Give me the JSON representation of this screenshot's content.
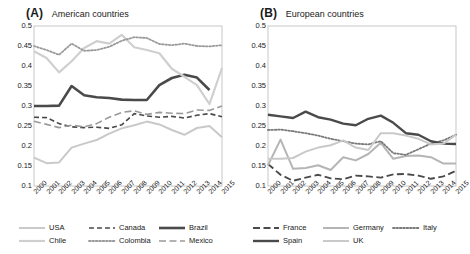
{
  "figure": {
    "panels": [
      {
        "letter": "(A)",
        "title": "American countries",
        "legend_rows": [
          [
            {
              "label": "USA",
              "key": "USA"
            },
            {
              "label": "Canada",
              "key": "Canada"
            },
            {
              "label": "Brazil",
              "key": "Brazil"
            }
          ],
          [
            {
              "label": "Chile",
              "key": "Chile"
            },
            {
              "label": "Colombia",
              "key": "Colombia"
            },
            {
              "label": "Mexico",
              "key": "Mexico"
            }
          ]
        ]
      },
      {
        "letter": "(B)",
        "title": "European countries",
        "legend_rows": [
          [
            {
              "label": "France",
              "key": "France"
            },
            {
              "label": "Germany",
              "key": "Germany"
            },
            {
              "label": "Italy",
              "key": "Italy"
            }
          ],
          [
            {
              "label": "Spain",
              "key": "Spain"
            },
            {
              "label": "UK",
              "key": "UK"
            }
          ]
        ]
      }
    ]
  },
  "chart_data": [
    {
      "type": "line",
      "title": "American countries",
      "panel": "(A)",
      "xlabel": "",
      "ylabel": "",
      "grid": false,
      "legend_position": "below",
      "x": [
        2000,
        2001,
        2002,
        2003,
        2004,
        2005,
        2006,
        2007,
        2008,
        2009,
        2010,
        2011,
        2012,
        2013,
        2014,
        2015
      ],
      "ylim": [
        0.1,
        0.5
      ],
      "yticks": [
        0.1,
        0.15,
        0.2,
        0.25,
        0.3,
        0.35,
        0.4,
        0.45,
        0.5
      ],
      "ytick_labels": [
        "0.1",
        "0.15",
        "0.2",
        "0.25",
        "0.3",
        "0.35",
        "0.4",
        "0.45",
        "0.5"
      ],
      "series": [
        {
          "name": "USA",
          "color": "#c9c9c9",
          "style": "solid",
          "width": 2.0,
          "values": [
            0.171,
            0.157,
            0.159,
            0.196,
            0.206,
            0.215,
            0.231,
            0.244,
            0.252,
            0.261,
            0.254,
            0.24,
            0.228,
            0.245,
            0.25,
            0.222
          ]
        },
        {
          "name": "Canada",
          "color": "#4a4a4a",
          "style": "dashed",
          "width": 1.6,
          "values": [
            0.272,
            0.271,
            0.256,
            0.248,
            0.246,
            0.247,
            0.244,
            0.253,
            0.281,
            0.275,
            0.272,
            0.274,
            0.27,
            0.277,
            0.281,
            0.273
          ]
        },
        {
          "name": "Brazil",
          "color": "#4a4a4a",
          "style": "solid",
          "width": 2.6,
          "values": [
            0.3,
            0.3,
            0.301,
            0.35,
            0.327,
            0.322,
            0.32,
            0.316,
            0.315,
            0.315,
            0.352,
            0.37,
            0.378,
            0.371,
            0.34,
            null
          ]
        },
        {
          "name": "Chile",
          "color": "#cfcfcf",
          "style": "solid",
          "width": 2.2,
          "values": [
            0.437,
            0.42,
            0.384,
            0.412,
            0.445,
            0.462,
            0.456,
            0.478,
            0.447,
            0.44,
            0.432,
            0.393,
            0.373,
            0.352,
            0.305,
            0.395
          ]
        },
        {
          "name": "Colombia",
          "color": "#9a9a9a",
          "style": "dotted",
          "width": 1.8,
          "values": [
            0.45,
            0.44,
            0.428,
            0.456,
            0.438,
            0.44,
            0.448,
            0.463,
            0.472,
            0.47,
            0.455,
            0.452,
            0.456,
            0.45,
            0.449,
            0.452
          ]
        },
        {
          "name": "Mexico",
          "color": "#9a9a9a",
          "style": "dash-long",
          "width": 1.6,
          "values": [
            0.262,
            0.254,
            0.246,
            0.252,
            0.248,
            0.256,
            0.272,
            0.284,
            0.288,
            0.279,
            0.284,
            0.282,
            0.281,
            0.29,
            0.289,
            0.3
          ]
        }
      ]
    },
    {
      "type": "line",
      "title": "European countries",
      "panel": "(B)",
      "xlabel": "",
      "ylabel": "",
      "grid": false,
      "legend_position": "below",
      "x": [
        2000,
        2001,
        2002,
        2003,
        2004,
        2005,
        2006,
        2007,
        2008,
        2009,
        2010,
        2011,
        2012,
        2013,
        2014,
        2015
      ],
      "ylim": [
        0.1,
        0.5
      ],
      "yticks": [
        0.1,
        0.15,
        0.2,
        0.25,
        0.3,
        0.35,
        0.4,
        0.45,
        0.5
      ],
      "ytick_labels": [
        "0.1",
        "0.15",
        "0.2",
        "0.25",
        "0.3",
        "0.35",
        "0.4",
        "0.45",
        "0.5"
      ],
      "series": [
        {
          "name": "France",
          "color": "#4a4a4a",
          "style": "dash-long",
          "width": 1.9,
          "values": [
            0.155,
            0.128,
            0.113,
            0.121,
            0.128,
            0.119,
            0.117,
            0.126,
            0.124,
            0.121,
            0.129,
            0.13,
            0.126,
            0.118,
            0.124,
            0.138
          ]
        },
        {
          "name": "Germany",
          "color": "#b5b5b5",
          "style": "solid",
          "width": 2.0,
          "values": [
            0.152,
            0.216,
            0.143,
            0.145,
            0.152,
            0.14,
            0.172,
            0.164,
            0.18,
            0.208,
            0.168,
            0.175,
            0.176,
            0.172,
            0.156,
            0.156
          ]
        },
        {
          "name": "Italy",
          "color": "#7a7a7a",
          "style": "dotted",
          "width": 1.8,
          "values": [
            0.24,
            0.241,
            0.237,
            0.232,
            0.226,
            0.218,
            0.212,
            0.206,
            0.204,
            0.212,
            0.182,
            0.178,
            0.192,
            0.206,
            0.214,
            0.228
          ]
        },
        {
          "name": "Spain",
          "color": "#4a4a4a",
          "style": "solid",
          "width": 2.4,
          "values": [
            0.278,
            0.274,
            0.27,
            0.286,
            0.272,
            0.266,
            0.256,
            0.252,
            0.268,
            0.276,
            0.258,
            0.232,
            0.228,
            0.212,
            0.206,
            0.205
          ]
        },
        {
          "name": "UK",
          "color": "#c9c9c9",
          "style": "solid",
          "width": 2.0,
          "values": [
            0.168,
            0.168,
            0.17,
            0.186,
            0.196,
            0.202,
            0.214,
            0.196,
            0.19,
            0.232,
            0.232,
            0.226,
            0.218,
            0.204,
            0.206,
            0.228
          ]
        }
      ]
    }
  ]
}
